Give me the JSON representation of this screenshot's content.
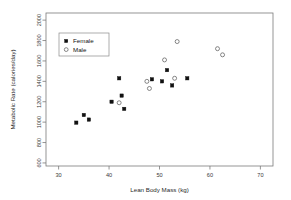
{
  "chart_data": {
    "type": "scatter",
    "title": "",
    "xlabel": "Lean Body Mass (kg)",
    "ylabel": "Metabolic Rate (calories/day)",
    "xlim": [
      27.5,
      72.5
    ],
    "ylim": [
      570,
      2070
    ],
    "xticks": [
      30,
      40,
      50,
      60,
      70
    ],
    "yticks": [
      600,
      800,
      1000,
      1200,
      1400,
      1600,
      1800,
      2000
    ],
    "grid": false,
    "legend_position": "top-left",
    "series": [
      {
        "name": "Female",
        "marker": "filled-square",
        "color": "#111111",
        "points": [
          [
            33.5,
            995
          ],
          [
            35.0,
            1070
          ],
          [
            36.0,
            1025
          ],
          [
            40.5,
            1200
          ],
          [
            42.0,
            1430
          ],
          [
            42.5,
            1260
          ],
          [
            43.0,
            1130
          ],
          [
            48.5,
            1420
          ],
          [
            50.5,
            1400
          ],
          [
            51.5,
            1510
          ],
          [
            52.5,
            1360
          ],
          [
            55.5,
            1430
          ]
        ]
      },
      {
        "name": "Male",
        "marker": "open-circle",
        "color": "#555555",
        "points": [
          [
            42.0,
            1190
          ],
          [
            47.5,
            1400
          ],
          [
            48.0,
            1330
          ],
          [
            51.0,
            1610
          ],
          [
            53.5,
            1790
          ],
          [
            53.0,
            1430
          ],
          [
            61.5,
            1720
          ],
          [
            62.5,
            1660
          ]
        ]
      }
    ]
  },
  "legend": {
    "entries": [
      {
        "label": "Female",
        "marker": "filled-square"
      },
      {
        "label": "Male",
        "marker": "open-circle"
      }
    ]
  },
  "axis_labels": {
    "x_title": "Lean Body Mass (kg)",
    "y_title": "Metabolic Rate (calories/day)",
    "x_tick_texts": [
      "30",
      "40",
      "50",
      "60",
      "70"
    ],
    "y_tick_texts": [
      "600",
      "800",
      "1000",
      "1200",
      "1400",
      "1600",
      "1800",
      "2000"
    ]
  }
}
